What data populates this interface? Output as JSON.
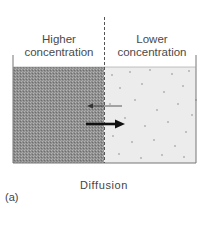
{
  "diagram": {
    "left_region": {
      "label": "Higher concentration",
      "fill": "#9a9a9a"
    },
    "right_region": {
      "label": "Lower concentration",
      "fill": "#ececec"
    },
    "arrows": [
      {
        "direction": "left",
        "weight": "thin",
        "meaning": "net flow low to high (small)"
      },
      {
        "direction": "right",
        "weight": "thick",
        "meaning": "net flow high to low (large)"
      }
    ],
    "caption": "Diffusion",
    "panel_label": "(a)"
  }
}
